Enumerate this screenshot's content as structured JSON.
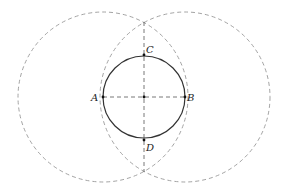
{
  "diagram": {
    "type": "geometric-construction",
    "colors": {
      "solid_stroke": "#333333",
      "dashed_stroke": "#999999",
      "axis_stroke": "#555555",
      "point_fill": "#111111",
      "label": "#222222"
    },
    "center": {
      "x": 144,
      "y": 97
    },
    "main_circle": {
      "cx": 144,
      "cy": 97,
      "r": 41,
      "style": "solid"
    },
    "construction_circles": [
      {
        "id": "circle-A",
        "cx": 103,
        "cy": 97,
        "r": 85,
        "style": "dashed"
      },
      {
        "id": "circle-B",
        "cx": 185,
        "cy": 97,
        "r": 85,
        "style": "dashed"
      }
    ],
    "lines": [
      {
        "id": "segment-AB",
        "x1": 103,
        "y1": 97,
        "x2": 185,
        "y2": 97,
        "style": "dashed"
      },
      {
        "id": "perpendicular-bisector",
        "x1": 144,
        "y1": 22,
        "x2": 144,
        "y2": 172,
        "style": "dashed"
      }
    ],
    "points": [
      {
        "id": "A",
        "label": "A",
        "x": 103,
        "y": 97,
        "lx": 91,
        "ly": 101
      },
      {
        "id": "B",
        "label": "B",
        "x": 185,
        "y": 97,
        "lx": 187,
        "ly": 101
      },
      {
        "id": "C",
        "label": "C",
        "x": 144,
        "y": 55,
        "lx": 146,
        "ly": 53
      },
      {
        "id": "D",
        "label": "D",
        "x": 144,
        "y": 140,
        "lx": 146,
        "ly": 151
      },
      {
        "id": "O",
        "label": "",
        "x": 144,
        "y": 97
      }
    ]
  }
}
